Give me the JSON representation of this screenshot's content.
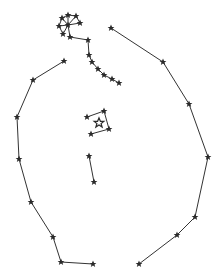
{
  "diagram": {
    "type": "constellation-map",
    "colors": {
      "ink": "#2a2a2a",
      "background": "#ffffff"
    },
    "stars": [
      {
        "id": "c1",
        "x": 68,
        "y": 15
      },
      {
        "id": "c2",
        "x": 62,
        "y": 18
      },
      {
        "id": "c3",
        "x": 76,
        "y": 16
      },
      {
        "id": "c4",
        "x": 80,
        "y": 23
      },
      {
        "id": "c5",
        "x": 59,
        "y": 26
      },
      {
        "id": "c6",
        "x": 68,
        "y": 25
      },
      {
        "id": "c7",
        "x": 63,
        "y": 34
      },
      {
        "id": "c8",
        "x": 70,
        "y": 37
      },
      {
        "id": "k1",
        "x": 88,
        "y": 40
      },
      {
        "id": "k2",
        "x": 89,
        "y": 55
      },
      {
        "id": "k3",
        "x": 92,
        "y": 62
      },
      {
        "id": "k4",
        "x": 98,
        "y": 69
      },
      {
        "id": "k5",
        "x": 104,
        "y": 75
      },
      {
        "id": "k6",
        "x": 112,
        "y": 79
      },
      {
        "id": "k7",
        "x": 119,
        "y": 83
      },
      {
        "id": "r1",
        "x": 111,
        "y": 28
      },
      {
        "id": "r2",
        "x": 163,
        "y": 62
      },
      {
        "id": "r3",
        "x": 189,
        "y": 104
      },
      {
        "id": "r4",
        "x": 208,
        "y": 157
      },
      {
        "id": "r5",
        "x": 195,
        "y": 217
      },
      {
        "id": "r6",
        "x": 177,
        "y": 235
      },
      {
        "id": "r7",
        "x": 139,
        "y": 264
      },
      {
        "id": "l1",
        "x": 64,
        "y": 61
      },
      {
        "id": "l2",
        "x": 33,
        "y": 80
      },
      {
        "id": "l3",
        "x": 17,
        "y": 117
      },
      {
        "id": "l4",
        "x": 19,
        "y": 159
      },
      {
        "id": "l5",
        "x": 31,
        "y": 202
      },
      {
        "id": "l6",
        "x": 53,
        "y": 237
      },
      {
        "id": "l7",
        "x": 61,
        "y": 262
      },
      {
        "id": "l8",
        "x": 93,
        "y": 264
      },
      {
        "id": "q1",
        "x": 87,
        "y": 117
      },
      {
        "id": "q2",
        "x": 104,
        "y": 111
      },
      {
        "id": "q3",
        "x": 109,
        "y": 129
      },
      {
        "id": "q4",
        "x": 91,
        "y": 134
      },
      {
        "id": "q5",
        "x": 99,
        "y": 123,
        "hollow": true
      },
      {
        "id": "t1",
        "x": 89,
        "y": 156
      },
      {
        "id": "t2",
        "x": 94,
        "y": 182
      }
    ],
    "lines": [
      [
        "c6",
        "c1"
      ],
      [
        "c6",
        "c2"
      ],
      [
        "c6",
        "c3"
      ],
      [
        "c6",
        "c4"
      ],
      [
        "c6",
        "c5"
      ],
      [
        "c6",
        "c7"
      ],
      [
        "c6",
        "c8"
      ],
      [
        "c2",
        "c1"
      ],
      [
        "c1",
        "c3"
      ],
      [
        "c3",
        "c4"
      ],
      [
        "c2",
        "c5"
      ],
      [
        "c5",
        "c7"
      ],
      [
        "c8",
        "k1"
      ],
      [
        "k1",
        "k2"
      ],
      [
        "k2",
        "k3"
      ],
      [
        "k3",
        "k4"
      ],
      [
        "k4",
        "k5"
      ],
      [
        "k5",
        "k6"
      ],
      [
        "k6",
        "k7"
      ],
      [
        "r1",
        "r2"
      ],
      [
        "r2",
        "r3"
      ],
      [
        "r3",
        "r4"
      ],
      [
        "r4",
        "r5"
      ],
      [
        "r5",
        "r6"
      ],
      [
        "r6",
        "r7"
      ],
      [
        "l1",
        "l2"
      ],
      [
        "l2",
        "l3"
      ],
      [
        "l3",
        "l4"
      ],
      [
        "l4",
        "l5"
      ],
      [
        "l5",
        "l6"
      ],
      [
        "l6",
        "l7"
      ],
      [
        "l7",
        "l8"
      ],
      [
        "q1",
        "q2"
      ],
      [
        "q2",
        "q3"
      ],
      [
        "q3",
        "q4"
      ],
      [
        "t1",
        "t2"
      ]
    ]
  }
}
